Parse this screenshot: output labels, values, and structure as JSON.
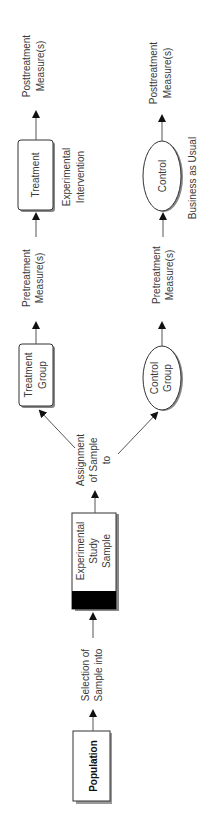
{
  "diagram": {
    "orientation": "rotated-90-ccw",
    "colors": {
      "stroke": "#333333",
      "text": "#3a3a3a",
      "fill": "#ffffff",
      "band": "#000000",
      "shadow": "#888888"
    },
    "nodes": {
      "population": {
        "label": "Population"
      },
      "sample": {
        "line1": "Experimental",
        "line2": "Study",
        "line3": "Sample"
      },
      "treatment_group": {
        "line1": "Treatment",
        "line2": "Group"
      },
      "control_group": {
        "line1": "Control",
        "line2": "Group"
      },
      "treatment": {
        "label": "Treatment"
      },
      "control": {
        "label": "Control"
      }
    },
    "edges": {
      "selection": {
        "line1": "Selection of",
        "line2": "Sample into"
      },
      "assignment": {
        "line1": "Assignment",
        "line2": "of Sample",
        "line3": "to"
      },
      "pre_treatment": {
        "line1": "Pretreatment",
        "line2": "Measure(s)"
      },
      "pre_control": {
        "line1": "Pretreatment",
        "line2": "Measure(s)"
      },
      "post_treatment": {
        "line1": "Posttreatment",
        "line2": "Measure(s)"
      },
      "post_control": {
        "line1": "Posttreatment",
        "line2": "Measure(s)"
      }
    },
    "annotations": {
      "experimental_intervention": {
        "line1": "Experimental",
        "line2": "Intervention"
      },
      "business_as_usual": {
        "label": "Business as Usual"
      }
    }
  }
}
